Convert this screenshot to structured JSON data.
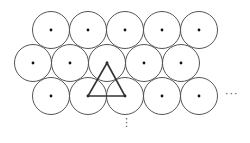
{
  "diagram": {
    "circle_radius": 18.5,
    "stroke_color": "#555555",
    "dot_color": "#111111",
    "rows": [
      {
        "y": 30,
        "xs": [
          51,
          88,
          125,
          162,
          199
        ]
      },
      {
        "y": 63,
        "xs": [
          33,
          70,
          107,
          144,
          181
        ]
      },
      {
        "y": 96,
        "xs": [
          51,
          88,
          125,
          162,
          199
        ]
      }
    ],
    "triangle": {
      "points": [
        [
          107,
          63
        ],
        [
          88,
          96
        ],
        [
          125,
          96
        ]
      ],
      "stroke_color": "#333333"
    },
    "continuation_right": "···",
    "continuation_down": "⋮"
  }
}
